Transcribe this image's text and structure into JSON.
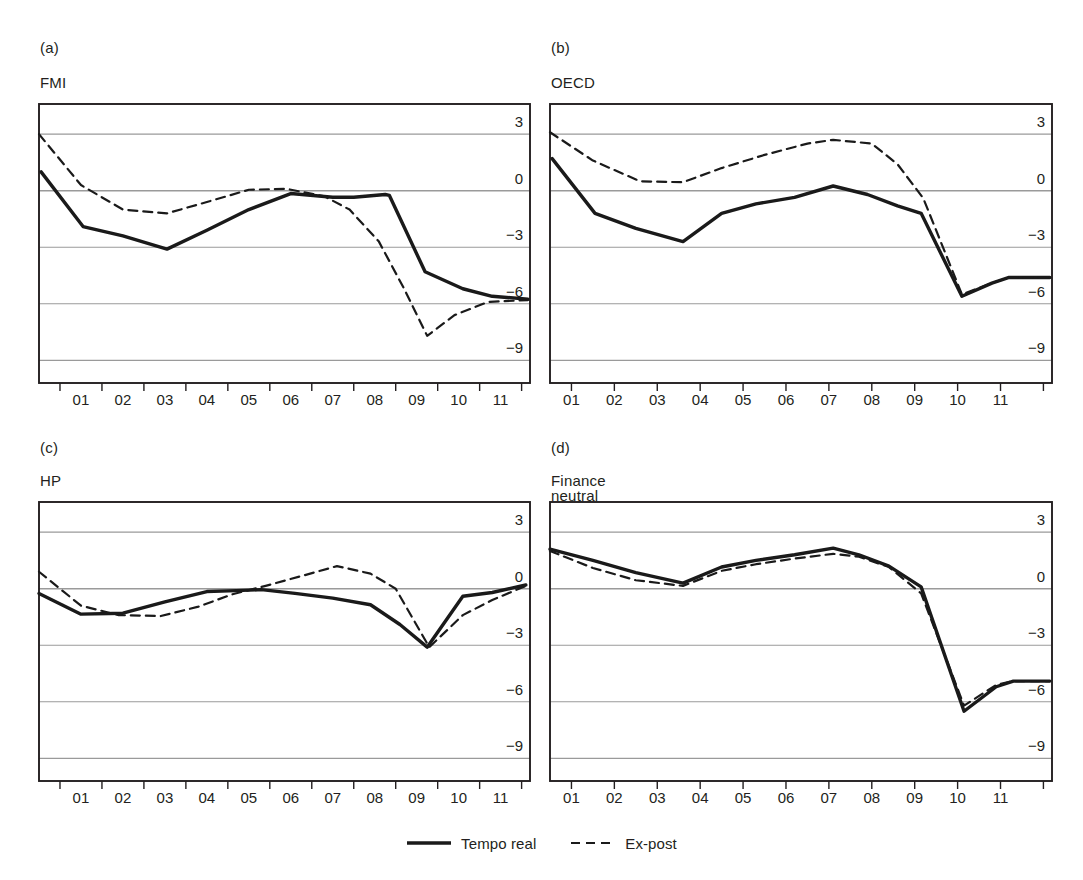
{
  "figure": {
    "background": "#ffffff",
    "line_color": "#1a1a1a",
    "grid_color": "#9a9a9a",
    "frame_color": "#231f20"
  },
  "legend": {
    "entries": [
      {
        "label": "Tempo real",
        "style": "solid",
        "name": "legend-tempo-real"
      },
      {
        "label": "Ex-post",
        "style": "dashed",
        "name": "legend-ex-post"
      }
    ]
  },
  "panels": [
    {
      "letter": "(a)",
      "title": "FMI",
      "x_label_mode": "between"
    },
    {
      "letter": "(b)",
      "title": "OECD",
      "x_label_mode": "on-tick"
    },
    {
      "letter": "(c)",
      "title": "HP",
      "x_label_mode": "between"
    },
    {
      "letter": "(d)",
      "title": "Finance neutral",
      "x_label_mode": "on-tick"
    }
  ],
  "chart_data": [
    {
      "panel": "a",
      "type": "line",
      "title": "FMI",
      "xlabel": "",
      "ylabel": "",
      "xlim": [
        0.5,
        12.2
      ],
      "ylim": [
        -10.2,
        4.6
      ],
      "yticks": [
        3,
        0,
        -3,
        -6,
        -9
      ],
      "ytick_labels": [
        "3",
        "0",
        "−3",
        "−6",
        "−9"
      ],
      "xticks": [
        1,
        2,
        3,
        4,
        5,
        6,
        7,
        8,
        9,
        10,
        11,
        12
      ],
      "xtick_labels": [
        "01",
        "02",
        "03",
        "04",
        "05",
        "06",
        "07",
        "08",
        "09",
        "10",
        "11"
      ],
      "grid": true,
      "legend": "bottom-center",
      "series": [
        {
          "name": "Tempo real",
          "style": "solid",
          "x": [
            0.55,
            1.55,
            2.5,
            3.55,
            4.5,
            5.5,
            6.5,
            7.5,
            8.0,
            8.75,
            8.85,
            9.7,
            10.6,
            11.3,
            12.15
          ],
          "values": [
            1.0,
            -1.9,
            -2.4,
            -3.1,
            -2.1,
            -1.0,
            -0.15,
            -0.35,
            -0.35,
            -0.2,
            -0.25,
            -4.3,
            -5.2,
            -5.6,
            -5.75
          ]
        },
        {
          "name": "Ex-post",
          "style": "dashed",
          "x": [
            0.5,
            1.5,
            2.5,
            3.55,
            4.5,
            5.5,
            6.4,
            7.3,
            7.9,
            8.6,
            9.2,
            9.75,
            10.4,
            11.2,
            12.15
          ],
          "values": [
            3.0,
            0.3,
            -1.0,
            -1.2,
            -0.6,
            0.05,
            0.1,
            -0.3,
            -1.0,
            -2.7,
            -5.2,
            -7.7,
            -6.6,
            -5.9,
            -5.8
          ]
        }
      ]
    },
    {
      "panel": "b",
      "type": "line",
      "title": "OECD",
      "xlabel": "",
      "ylabel": "",
      "xlim": [
        0.5,
        12.2
      ],
      "ylim": [
        -10.2,
        4.6
      ],
      "yticks": [
        3,
        0,
        -3,
        -6,
        -9
      ],
      "ytick_labels": [
        "3",
        "0",
        "−3",
        "−6",
        "−9"
      ],
      "xticks": [
        1,
        2,
        3,
        4,
        5,
        6,
        7,
        8,
        9,
        10,
        11,
        12
      ],
      "xtick_labels": [
        "01",
        "02",
        "03",
        "04",
        "05",
        "06",
        "07",
        "08",
        "09",
        "10",
        "11"
      ],
      "grid": true,
      "legend": "bottom-center",
      "series": [
        {
          "name": "Tempo real",
          "style": "solid",
          "x": [
            0.55,
            1.55,
            2.5,
            3.6,
            4.5,
            5.3,
            6.2,
            7.1,
            7.9,
            8.6,
            9.15,
            10.1,
            10.8,
            11.2,
            12.15
          ],
          "values": [
            1.7,
            -1.2,
            -2.0,
            -2.7,
            -1.2,
            -0.7,
            -0.35,
            0.25,
            -0.2,
            -0.8,
            -1.2,
            -5.6,
            -4.9,
            -4.6,
            -4.6
          ]
        },
        {
          "name": "Ex-post",
          "style": "dashed",
          "x": [
            0.5,
            1.5,
            2.6,
            3.6,
            4.5,
            5.5,
            6.5,
            7.1,
            8.0,
            8.6,
            9.2,
            10.1,
            10.8,
            11.2,
            12.15
          ],
          "values": [
            3.1,
            1.6,
            0.5,
            0.45,
            1.2,
            1.9,
            2.5,
            2.7,
            2.5,
            1.4,
            -0.4,
            -5.5,
            -4.9,
            -4.6,
            -4.6
          ]
        }
      ]
    },
    {
      "panel": "c",
      "type": "line",
      "title": "HP",
      "xlabel": "",
      "ylabel": "",
      "xlim": [
        0.5,
        12.2
      ],
      "ylim": [
        -10.2,
        4.6
      ],
      "yticks": [
        3,
        0,
        -3,
        -6,
        -9
      ],
      "ytick_labels": [
        "3",
        "0",
        "−3",
        "−6",
        "−9"
      ],
      "xticks": [
        1,
        2,
        3,
        4,
        5,
        6,
        7,
        8,
        9,
        10,
        11,
        12
      ],
      "xtick_labels": [
        "01",
        "02",
        "03",
        "04",
        "05",
        "06",
        "07",
        "08",
        "09",
        "10",
        "11"
      ],
      "grid": true,
      "legend": "bottom-center",
      "series": [
        {
          "name": "Tempo real",
          "style": "solid",
          "x": [
            0.5,
            1.5,
            2.5,
            3.5,
            4.5,
            5.2,
            5.8,
            6.6,
            7.5,
            8.4,
            9.1,
            9.75,
            10.6,
            11.3,
            12.1
          ],
          "values": [
            -0.25,
            -1.35,
            -1.3,
            -0.7,
            -0.15,
            -0.1,
            -0.05,
            -0.25,
            -0.5,
            -0.85,
            -1.9,
            -3.1,
            -0.4,
            -0.2,
            0.2
          ]
        },
        {
          "name": "Ex-post",
          "style": "dashed",
          "x": [
            0.5,
            1.5,
            2.4,
            3.4,
            4.3,
            5.1,
            5.9,
            6.8,
            7.6,
            8.4,
            9.0,
            9.8,
            10.6,
            11.3,
            12.1
          ],
          "values": [
            0.9,
            -0.9,
            -1.4,
            -1.45,
            -0.95,
            -0.3,
            0.15,
            0.7,
            1.2,
            0.8,
            0.0,
            -3.1,
            -1.4,
            -0.6,
            0.15
          ]
        }
      ]
    },
    {
      "panel": "d",
      "type": "line",
      "title": "Finance neutral",
      "xlabel": "",
      "ylabel": "",
      "xlim": [
        0.5,
        12.2
      ],
      "ylim": [
        -10.2,
        4.6
      ],
      "yticks": [
        3,
        0,
        -3,
        -6,
        -9
      ],
      "ytick_labels": [
        "3",
        "0",
        "−3",
        "−6",
        "−9"
      ],
      "xticks": [
        1,
        2,
        3,
        4,
        5,
        6,
        7,
        8,
        9,
        10,
        11,
        12
      ],
      "xtick_labels": [
        "01",
        "02",
        "03",
        "04",
        "05",
        "06",
        "07",
        "08",
        "09",
        "10",
        "11"
      ],
      "grid": true,
      "legend": "bottom-center",
      "series": [
        {
          "name": "Tempo real",
          "style": "solid",
          "x": [
            0.5,
            1.5,
            2.5,
            3.6,
            4.5,
            5.3,
            6.2,
            7.1,
            7.7,
            8.4,
            9.15,
            10.15,
            10.9,
            11.3,
            12.15
          ],
          "values": [
            2.1,
            1.5,
            0.85,
            0.3,
            1.15,
            1.5,
            1.8,
            2.15,
            1.8,
            1.2,
            0.1,
            -6.5,
            -5.2,
            -4.9,
            -4.9
          ]
        },
        {
          "name": "Ex-post",
          "style": "dashed",
          "x": [
            0.5,
            1.5,
            2.5,
            3.6,
            4.5,
            5.3,
            6.2,
            7.1,
            7.7,
            8.4,
            9.15,
            10.15,
            10.9,
            11.3,
            12.15
          ],
          "values": [
            2.0,
            1.1,
            0.45,
            0.15,
            0.95,
            1.3,
            1.6,
            1.85,
            1.7,
            1.15,
            -0.25,
            -6.2,
            -5.1,
            -4.9,
            -4.9
          ]
        }
      ]
    }
  ]
}
